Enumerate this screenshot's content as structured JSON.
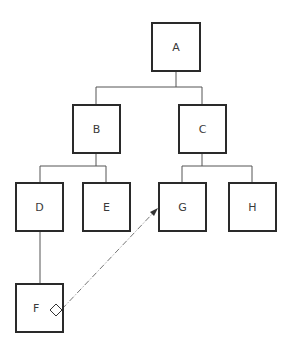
{
  "diagram": {
    "type": "tree",
    "nodes": [
      {
        "id": "A",
        "label": "A",
        "x": 151,
        "y": 22,
        "w": 50,
        "h": 50
      },
      {
        "id": "B",
        "label": "B",
        "x": 72,
        "y": 104,
        "w": 49,
        "h": 50
      },
      {
        "id": "C",
        "label": "C",
        "x": 178,
        "y": 104,
        "w": 49,
        "h": 50
      },
      {
        "id": "D",
        "label": "D",
        "x": 15,
        "y": 182,
        "w": 49,
        "h": 50
      },
      {
        "id": "E",
        "label": "E",
        "x": 82,
        "y": 182,
        "w": 49,
        "h": 50
      },
      {
        "id": "G",
        "label": "G",
        "x": 158,
        "y": 182,
        "w": 49,
        "h": 50
      },
      {
        "id": "H",
        "label": "H",
        "x": 228,
        "y": 182,
        "w": 49,
        "h": 50
      },
      {
        "id": "F",
        "label": "F",
        "x": 15,
        "y": 283,
        "w": 49,
        "h": 50
      }
    ],
    "edges": [
      {
        "from": "A",
        "to": "B",
        "style": "solid"
      },
      {
        "from": "A",
        "to": "C",
        "style": "solid"
      },
      {
        "from": "B",
        "to": "D",
        "style": "solid"
      },
      {
        "from": "B",
        "to": "E",
        "style": "solid"
      },
      {
        "from": "C",
        "to": "G",
        "style": "solid"
      },
      {
        "from": "C",
        "to": "H",
        "style": "solid"
      },
      {
        "from": "D",
        "to": "F",
        "style": "solid"
      },
      {
        "from": "F",
        "to": "G",
        "style": "dash-dot",
        "arrow": "end",
        "source_marker": "diamond"
      }
    ],
    "colors": {
      "stroke": "#2a2a2a",
      "line": "#555555",
      "text": "#3a3a3a",
      "background": "#ffffff"
    }
  }
}
